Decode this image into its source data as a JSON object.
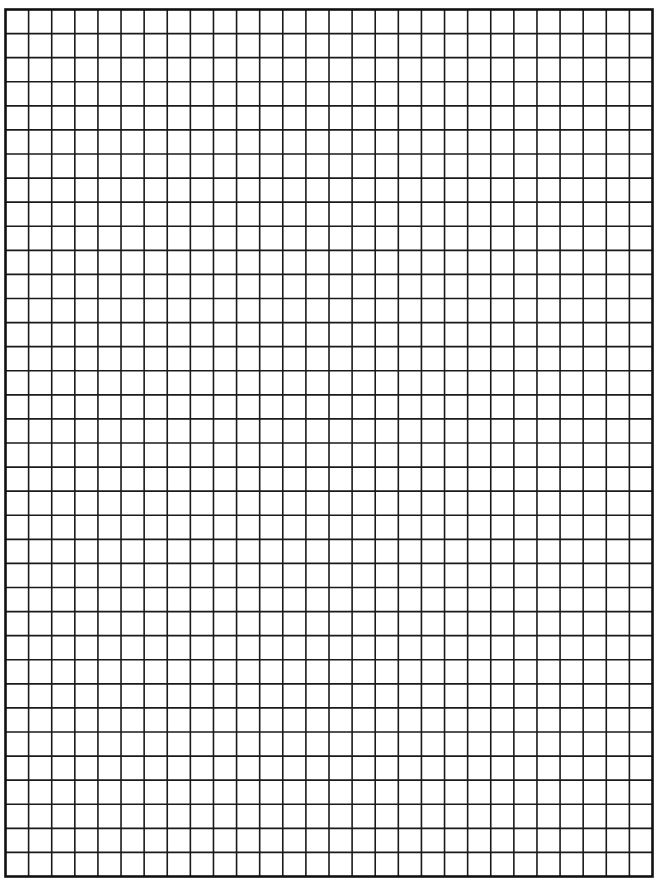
{
  "page": {
    "width": 655,
    "height": 882,
    "background": "#ffffff"
  },
  "grid": {
    "type": "graph-paper",
    "columns": 28,
    "rows": 36,
    "left": 5.5,
    "top": 9.5,
    "right": 652.5,
    "bottom": 876.5,
    "line_color": "#1a1a1a",
    "line_width": 1.6,
    "border_color": "#111111",
    "border_width": 2.6
  }
}
